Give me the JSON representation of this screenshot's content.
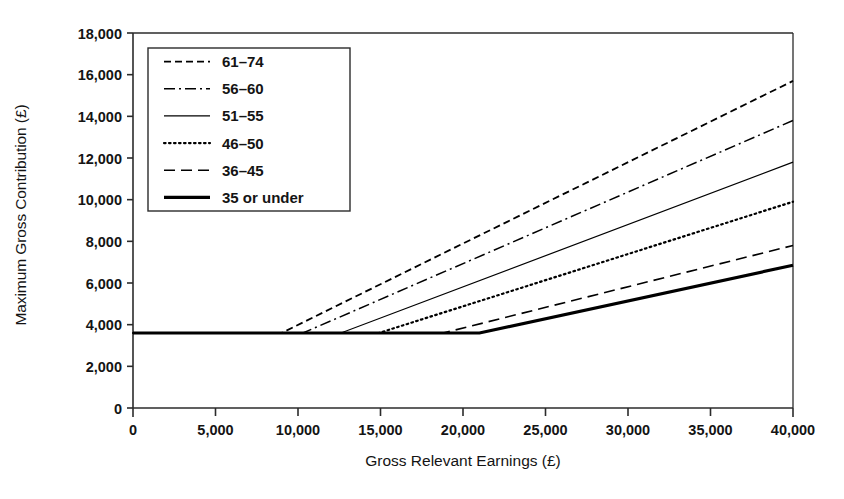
{
  "chart_data": {
    "type": "line",
    "title": "",
    "xlabel": "Gross Relevant Earnings (£)",
    "ylabel": "Maximum Gross Contribution (£)",
    "xlim": [
      0,
      40000
    ],
    "ylim": [
      0,
      18000
    ],
    "xticks": [
      0,
      5000,
      10000,
      15000,
      20000,
      25000,
      30000,
      35000,
      40000
    ],
    "xtick_labels": [
      "0",
      "5,000",
      "10,000",
      "15,000",
      "20,000",
      "25,000",
      "30,000",
      "35,000",
      "40,000"
    ],
    "yticks": [
      0,
      2000,
      4000,
      6000,
      8000,
      10000,
      12000,
      14000,
      16000,
      18000
    ],
    "ytick_labels": [
      "0",
      "2,000",
      "4,000",
      "6,000",
      "8,000",
      "10,000",
      "12,000",
      "14,000",
      "16,000",
      "18,000"
    ],
    "grid": false,
    "legend_position": "upper-left",
    "flat_floor_value": 3600,
    "series": [
      {
        "name": "61–74",
        "dash_style": "dashed",
        "line_width": 1.8,
        "percent_of_earnings": 40,
        "breakpoint_x": 9000,
        "points": [
          [
            0,
            3600
          ],
          [
            9000,
            3600
          ],
          [
            40000,
            15700
          ]
        ]
      },
      {
        "name": "56–60",
        "dash_style": "dash-dot",
        "line_width": 1.5,
        "percent_of_earnings": 35,
        "breakpoint_x": 10300,
        "points": [
          [
            0,
            3600
          ],
          [
            10300,
            3600
          ],
          [
            40000,
            13800
          ]
        ]
      },
      {
        "name": "51–55",
        "dash_style": "solid",
        "line_width": 1.2,
        "percent_of_earnings": 30,
        "breakpoint_x": 12600,
        "points": [
          [
            0,
            3600
          ],
          [
            12600,
            3600
          ],
          [
            40000,
            11800
          ]
        ]
      },
      {
        "name": "46–50",
        "dash_style": "dotted",
        "line_width": 2.2,
        "percent_of_earnings": 25,
        "breakpoint_x": 14900,
        "points": [
          [
            0,
            3600
          ],
          [
            14900,
            3600
          ],
          [
            40000,
            9900
          ]
        ]
      },
      {
        "name": "36–45",
        "dash_style": "long-dashed",
        "line_width": 1.6,
        "percent_of_earnings": 20,
        "breakpoint_x": 18800,
        "points": [
          [
            0,
            3600
          ],
          [
            18800,
            3600
          ],
          [
            40000,
            7800
          ]
        ]
      },
      {
        "name": "35 or under",
        "dash_style": "solid-bold",
        "line_width": 3.2,
        "percent_of_earnings": 17.5,
        "breakpoint_x": 21000,
        "points": [
          [
            0,
            3600
          ],
          [
            21000,
            3600
          ],
          [
            40000,
            6850
          ]
        ]
      }
    ]
  },
  "legend": {
    "items": [
      {
        "label": "61–74"
      },
      {
        "label": "56–60"
      },
      {
        "label": "51–55"
      },
      {
        "label": "46–50"
      },
      {
        "label": "36–45"
      },
      {
        "label": "35 or under"
      }
    ]
  },
  "colors": {
    "line": "#000000",
    "axis": "#2b2b2b",
    "text": "#141414",
    "background": "#ffffff"
  }
}
